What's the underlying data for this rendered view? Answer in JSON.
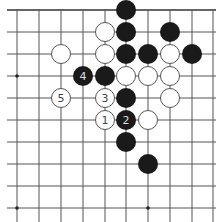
{
  "diagram": {
    "type": "go-board-fragment",
    "colors": {
      "background": "#ffffff",
      "line": "#555555",
      "edge": "#666666",
      "black_stone": "#1a1a1a",
      "white_stone_fill": "#ffffff",
      "white_stone_stroke": "#555555",
      "label_on_white": "#444444",
      "label_on_black": "#dddddd"
    },
    "grid": {
      "columns_x": [
        17,
        39,
        61,
        83,
        105,
        126,
        148,
        170,
        192,
        213
      ],
      "rows_y": [
        10,
        32,
        54,
        76,
        98,
        120,
        142,
        164,
        186,
        208
      ],
      "top_edge": true,
      "stone_radius": 10
    },
    "star_points": [
      {
        "col": 0,
        "row": 3
      },
      {
        "col": 0,
        "row": 9
      },
      {
        "col": 6,
        "row": 9
      }
    ],
    "stones": [
      {
        "color": "black",
        "col": 5,
        "row": 0,
        "label": ""
      },
      {
        "color": "white",
        "col": 4,
        "row": 1,
        "label": ""
      },
      {
        "color": "black",
        "col": 5,
        "row": 1,
        "label": ""
      },
      {
        "color": "black",
        "col": 7,
        "row": 1,
        "label": ""
      },
      {
        "color": "white",
        "col": 2,
        "row": 2,
        "label": ""
      },
      {
        "color": "white",
        "col": 4,
        "row": 2,
        "label": ""
      },
      {
        "color": "black",
        "col": 5,
        "row": 2,
        "label": ""
      },
      {
        "color": "black",
        "col": 6,
        "row": 2,
        "label": ""
      },
      {
        "color": "white",
        "col": 7,
        "row": 2,
        "label": ""
      },
      {
        "color": "black",
        "col": 8,
        "row": 2,
        "label": ""
      },
      {
        "color": "black",
        "col": 3,
        "row": 3,
        "label": "4"
      },
      {
        "color": "black",
        "col": 4,
        "row": 3,
        "label": ""
      },
      {
        "color": "white",
        "col": 5,
        "row": 3,
        "label": ""
      },
      {
        "color": "white",
        "col": 6,
        "row": 3,
        "label": ""
      },
      {
        "color": "white",
        "col": 7,
        "row": 3,
        "label": ""
      },
      {
        "color": "white",
        "col": 2,
        "row": 4,
        "label": "5"
      },
      {
        "color": "white",
        "col": 4,
        "row": 4,
        "label": "3"
      },
      {
        "color": "black",
        "col": 5,
        "row": 4,
        "label": ""
      },
      {
        "color": "white",
        "col": 7,
        "row": 4,
        "label": ""
      },
      {
        "color": "white",
        "col": 4,
        "row": 5,
        "label": "1"
      },
      {
        "color": "black",
        "col": 5,
        "row": 5,
        "label": "2"
      },
      {
        "color": "white",
        "col": 6,
        "row": 5,
        "label": ""
      },
      {
        "color": "black",
        "col": 5,
        "row": 6,
        "label": ""
      },
      {
        "color": "black",
        "col": 6,
        "row": 7,
        "label": ""
      }
    ]
  }
}
